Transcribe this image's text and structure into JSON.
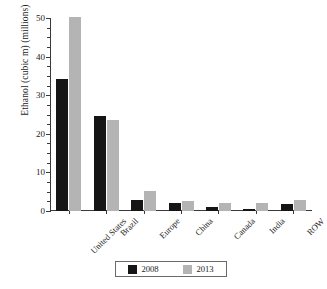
{
  "chart_data": {
    "type": "bar",
    "title": "",
    "xlabel": "",
    "ylabel": "Ethanol (cubic m) (millions)",
    "categories": [
      "United States",
      "Brazil",
      "Europe",
      "China",
      "Canada",
      "India",
      "ROW"
    ],
    "series": [
      {
        "name": "2008",
        "color": "#151515",
        "values": [
          34.2,
          24.5,
          2.9,
          2.1,
          1.1,
          0.4,
          1.7
        ]
      },
      {
        "name": "2013",
        "color": "#b4b4b4",
        "values": [
          50.3,
          23.6,
          5.1,
          2.5,
          2.0,
          2.2,
          2.8
        ]
      }
    ],
    "ylim": [
      0,
      50
    ],
    "y_ticks": [
      0,
      10,
      20,
      30,
      40,
      50
    ],
    "y_tick_labels": [
      "0",
      "10",
      "20",
      "30",
      "40",
      "50"
    ],
    "y_minor_tick_step": 2.5,
    "grid": false,
    "legend_position": "bottom-center",
    "legend_entries": [
      "2008",
      "2013"
    ]
  }
}
